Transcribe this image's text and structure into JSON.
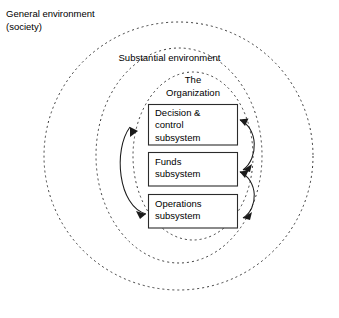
{
  "diagram": {
    "environments": [
      {
        "id": "general",
        "label": "General environment\n(society)",
        "shape": "dashed-ellipse",
        "label_position": "outside-top-left"
      },
      {
        "id": "substantial",
        "label": "Substantial environment",
        "shape": "dashed-ellipse",
        "label_position": "inside-top-center"
      },
      {
        "id": "organization",
        "label": "The\nOrganization",
        "shape": "dashed-ellipse",
        "label_position": "inside-top-center"
      }
    ],
    "subsystems": [
      {
        "id": "decision",
        "label": "Decision &\ncontrol\nsubsystem"
      },
      {
        "id": "funds",
        "label": "Funds\nsubsystem"
      },
      {
        "id": "operations",
        "label": "Operations\nsubsystem"
      }
    ],
    "connections": [
      {
        "from": "decision",
        "to": "funds",
        "side": "right",
        "style": "curved-arrow"
      },
      {
        "from": "funds",
        "to": "operations",
        "side": "right",
        "style": "curved-arrow"
      },
      {
        "from": "operations",
        "to": "decision",
        "side": "left",
        "style": "curved-double-arrow"
      }
    ],
    "colors": {
      "background": "#ffffff",
      "ellipse_stroke": "#3b3b3b",
      "box_stroke": "#2b2b2b",
      "arrow_stroke": "#1a1a1a",
      "text": "#000000"
    }
  }
}
